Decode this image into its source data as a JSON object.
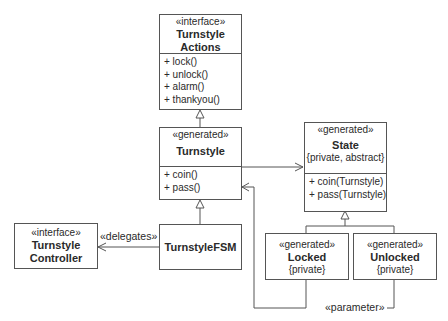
{
  "diagram": {
    "type": "UML class diagram",
    "classes": {
      "turnstyle_actions": {
        "stereotype": "«interface»",
        "name_line1": "Turnstyle",
        "name_line2": "Actions",
        "operations": [
          "+ lock()",
          "+ unlock()",
          "+ alarm()",
          "+ thankyou()"
        ]
      },
      "turnstyle": {
        "stereotype": "«generated»",
        "name": "Turnstyle",
        "operations": [
          "+ coin()",
          "+ pass()"
        ]
      },
      "state": {
        "stereotype": "«generated»",
        "name": "State",
        "properties": "{private, abstract}",
        "operations": [
          "+ coin(Turnstyle)",
          "+ pass(Turnstyle)"
        ]
      },
      "turnstyle_fsm": {
        "name": "TurnstyleFSM"
      },
      "turnstyle_controller": {
        "stereotype": "«interface»",
        "name_line1": "Turnstyle",
        "name_line2": "Controller"
      },
      "locked": {
        "stereotype": "«generated»",
        "name": "Locked",
        "properties": "{private}"
      },
      "unlocked": {
        "stereotype": "«generated»",
        "name": "Unlocked",
        "properties": "{private}"
      }
    },
    "relations": {
      "delegates_label": "«delegates»",
      "parameter_label": "«parameter»"
    },
    "colors": {
      "line": "#555555",
      "background": "#ffffff",
      "text": "#2a2a2a"
    }
  }
}
